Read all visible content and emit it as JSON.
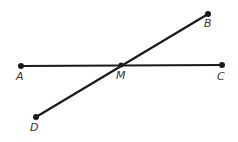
{
  "diagram": {
    "type": "geometry",
    "points": [
      {
        "id": "A",
        "label": "A",
        "x": 21,
        "y": 66,
        "label_x": 16,
        "label_y": 80
      },
      {
        "id": "M",
        "label": "M",
        "x": 121,
        "y": 65,
        "label_x": 116,
        "label_y": 79
      },
      {
        "id": "C",
        "label": "C",
        "x": 222,
        "y": 65,
        "label_x": 217,
        "label_y": 80
      },
      {
        "id": "B",
        "label": "B",
        "x": 208,
        "y": 14,
        "label_x": 204,
        "label_y": 27
      },
      {
        "id": "D",
        "label": "D",
        "x": 36,
        "y": 117,
        "label_x": 30,
        "label_y": 131
      }
    ],
    "segments": [
      {
        "from": "A",
        "to": "C"
      },
      {
        "from": "D",
        "to": "B"
      }
    ],
    "colors": {
      "stroke": "#1a1a1a",
      "label": "#333333",
      "background": "#ffffff"
    }
  }
}
